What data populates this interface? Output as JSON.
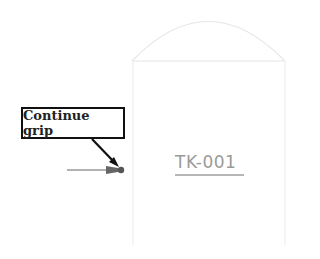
{
  "callout": {
    "label": "Continue grip"
  },
  "tank": {
    "tag": "TK-001"
  },
  "colors": {
    "outline": "#e6e6e6",
    "tag_text": "#9a9a9a",
    "tag_underline": "#6f6f6f",
    "callout_border": "#111111",
    "grip": "#555555"
  }
}
